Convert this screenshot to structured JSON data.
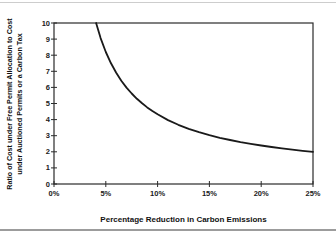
{
  "figure": {
    "background": "#ffffff",
    "top_rule_color": "#cdcdcd",
    "bottom_rule_color": "#9c9c9c"
  },
  "chart_data": {
    "type": "line",
    "title": "",
    "xlabel": "Percentage Reduction in Carbon Emissions",
    "ylabel_line1": "Ratio of Cost under Free Permit Allocation to Cost",
    "ylabel_line2": "under Auctioned Permits or a Carbon Tax",
    "xlim": [
      0,
      25
    ],
    "ylim": [
      0,
      10
    ],
    "grid": false,
    "legend": "none",
    "line_color": "#1a1a1a",
    "frame_color": "#2b2b2b",
    "x_ticks": [
      {
        "value": 0,
        "label": "0%"
      },
      {
        "value": 5,
        "label": "5%"
      },
      {
        "value": 10,
        "label": "10%"
      },
      {
        "value": 15,
        "label": "15%"
      },
      {
        "value": 20,
        "label": "20%"
      },
      {
        "value": 25,
        "label": "25%"
      }
    ],
    "y_ticks": [
      {
        "value": 0,
        "label": "0"
      },
      {
        "value": 1,
        "label": "1"
      },
      {
        "value": 2,
        "label": "2"
      },
      {
        "value": 3,
        "label": "3"
      },
      {
        "value": 4,
        "label": "4"
      },
      {
        "value": 5,
        "label": "5"
      },
      {
        "value": 6,
        "label": "6"
      },
      {
        "value": 7,
        "label": "7"
      },
      {
        "value": 8,
        "label": "8"
      },
      {
        "value": 9,
        "label": "9"
      },
      {
        "value": 10,
        "label": "10"
      }
    ],
    "series": [
      {
        "name": "cost-ratio",
        "x": [
          4.06,
          4.5,
          5,
          5.5,
          6,
          6.5,
          7,
          7.5,
          8,
          8.5,
          9,
          9.5,
          10,
          11,
          12,
          13,
          14,
          15,
          16,
          17,
          18,
          19,
          20,
          21,
          22,
          23,
          24,
          25
        ],
        "y": [
          10.0,
          9.06,
          8.2,
          7.5,
          6.91,
          6.41,
          5.99,
          5.62,
          5.29,
          5.01,
          4.76,
          4.53,
          4.33,
          3.97,
          3.68,
          3.43,
          3.22,
          3.03,
          2.87,
          2.73,
          2.6,
          2.49,
          2.39,
          2.3,
          2.21,
          2.13,
          2.06,
          2.0
        ]
      }
    ]
  }
}
